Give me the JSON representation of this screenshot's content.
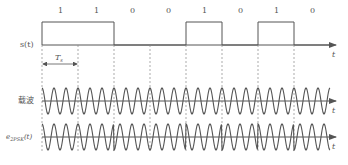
{
  "diagram": {
    "bits": [
      "1",
      "1",
      "0",
      "0",
      "1",
      "0",
      "1",
      "0"
    ],
    "labels": {
      "signal": "s(t)",
      "carrier": "载波",
      "modulated": "e2PSK(t)",
      "modulated_main": "e",
      "modulated_sub": "2PSK",
      "modulated_tail": "(t)",
      "time_axis": "t",
      "symbol_period": "Ts",
      "symbol_period_main": "T",
      "symbol_period_sub": "s"
    },
    "geometry": {
      "x0": 42,
      "symbol_width": 36,
      "cycles_per_symbol": 3,
      "signal_high_y": 22,
      "signal_base_y": 45,
      "carrier_axis_y": 101,
      "modulated_axis_y": 137,
      "amplitude": 13,
      "axis_end_x": 336
    },
    "colors": {
      "line": "#555555",
      "dashed": "#888888",
      "text": "#555555"
    }
  }
}
